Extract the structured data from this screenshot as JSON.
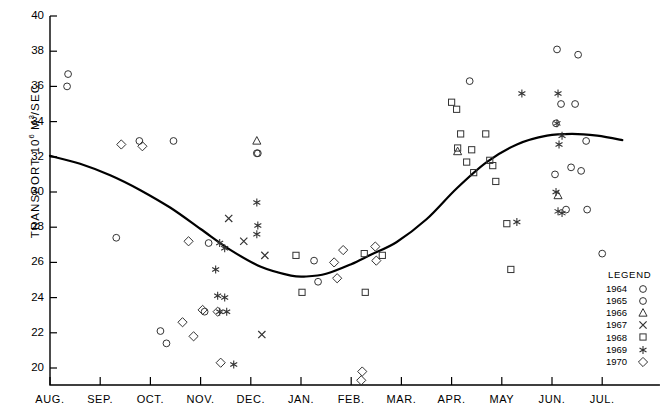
{
  "chart_data": {
    "type": "scatter",
    "title": "",
    "xlabel": "",
    "ylabel": "TRANSPORT 10⁶ M³/SEC.",
    "ylim": [
      19.1,
      40
    ],
    "yticks": [
      20,
      22,
      24,
      26,
      28,
      30,
      32,
      34,
      36,
      38,
      40
    ],
    "categories": [
      "AUG.",
      "SEP.",
      "OCT.",
      "NOV.",
      "DEC.",
      "JAN.",
      "FEB.",
      "MAR.",
      "APR.",
      "MAY",
      "JUN.",
      "JUL."
    ],
    "grid": false,
    "legend_position": "bottom-right",
    "legend_title": "LEGEND",
    "series": [
      {
        "name": "1964",
        "marker": "circle",
        "points": [
          {
            "month": "AUG.",
            "x": 0.36,
            "y": 36.7
          },
          {
            "month": "AUG.",
            "x": 0.34,
            "y": 36.0
          },
          {
            "month": "SEP.",
            "x": 1.78,
            "y": 32.9
          },
          {
            "month": "OCT.",
            "x": 2.46,
            "y": 32.9
          },
          {
            "month": "NOV.",
            "x": 3.16,
            "y": 27.1
          },
          {
            "month": "DEC.",
            "x": 4.14,
            "y": 32.2
          },
          {
            "month": "APR.",
            "x": 8.36,
            "y": 36.3
          },
          {
            "month": "JUN.",
            "x": 10.1,
            "y": 38.1
          },
          {
            "month": "JUN.",
            "x": 10.52,
            "y": 37.8
          },
          {
            "month": "JUN.",
            "x": 10.18,
            "y": 35.0
          },
          {
            "month": "JUN.",
            "x": 10.46,
            "y": 35.0
          },
          {
            "month": "JUN.",
            "x": 10.08,
            "y": 33.9
          },
          {
            "month": "JUN.",
            "x": 10.68,
            "y": 32.9
          },
          {
            "month": "JUN.",
            "x": 10.38,
            "y": 31.4
          },
          {
            "month": "JUN.",
            "x": 10.58,
            "y": 31.2
          },
          {
            "month": "JUN.",
            "x": 10.06,
            "y": 31.0
          },
          {
            "month": "JUN.",
            "x": 10.28,
            "y": 29.0
          },
          {
            "month": "JUN.",
            "x": 10.7,
            "y": 29.0
          },
          {
            "month": "JUL.",
            "x": 11.0,
            "y": 26.5
          }
        ]
      },
      {
        "name": "1965",
        "marker": "circle",
        "points": [
          {
            "month": "SEP.",
            "x": 1.32,
            "y": 27.4
          },
          {
            "month": "OCT.",
            "x": 2.2,
            "y": 22.1
          },
          {
            "month": "OCT.",
            "x": 2.32,
            "y": 21.4
          },
          {
            "month": "NOV.",
            "x": 3.08,
            "y": 23.2
          },
          {
            "month": "DEC.",
            "x": 4.12,
            "y": 32.2
          },
          {
            "month": "JAN.",
            "x": 5.26,
            "y": 26.1
          },
          {
            "month": "JAN.",
            "x": 5.34,
            "y": 24.9
          }
        ]
      },
      {
        "name": "1966",
        "marker": "triangle",
        "points": [
          {
            "month": "DEC.",
            "x": 4.12,
            "y": 32.9
          },
          {
            "month": "APR.",
            "x": 8.12,
            "y": 32.3
          },
          {
            "month": "JUN.",
            "x": 10.12,
            "y": 29.8
          }
        ]
      },
      {
        "name": "1967",
        "marker": "x",
        "points": [
          {
            "month": "NOV.",
            "x": 3.56,
            "y": 28.5
          },
          {
            "month": "DEC.",
            "x": 3.86,
            "y": 27.2
          },
          {
            "month": "DEC.",
            "x": 4.28,
            "y": 26.4
          },
          {
            "month": "DEC.",
            "x": 4.22,
            "y": 21.9
          }
        ]
      },
      {
        "name": "1968",
        "marker": "square",
        "points": [
          {
            "month": "DEC.",
            "x": 4.9,
            "y": 26.4
          },
          {
            "month": "JAN.",
            "x": 5.02,
            "y": 24.3
          },
          {
            "month": "FEB.",
            "x": 6.26,
            "y": 26.5
          },
          {
            "month": "FEB.",
            "x": 6.62,
            "y": 26.4
          },
          {
            "month": "FEB.",
            "x": 6.28,
            "y": 24.3
          },
          {
            "month": "APR.",
            "x": 8.0,
            "y": 35.1
          },
          {
            "month": "APR.",
            "x": 8.1,
            "y": 34.7
          },
          {
            "month": "APR.",
            "x": 8.18,
            "y": 33.3
          },
          {
            "month": "APR.",
            "x": 8.12,
            "y": 32.5
          },
          {
            "month": "APR.",
            "x": 8.4,
            "y": 32.4
          },
          {
            "month": "APR.",
            "x": 8.3,
            "y": 31.7
          },
          {
            "month": "APR.",
            "x": 8.44,
            "y": 31.1
          },
          {
            "month": "APR.",
            "x": 8.68,
            "y": 33.3
          },
          {
            "month": "APR.",
            "x": 8.76,
            "y": 31.8
          },
          {
            "month": "APR.",
            "x": 8.82,
            "y": 31.5
          },
          {
            "month": "APR.",
            "x": 8.88,
            "y": 30.6
          },
          {
            "month": "MAY",
            "x": 9.1,
            "y": 28.2
          },
          {
            "month": "MAY",
            "x": 9.18,
            "y": 25.6
          }
        ]
      },
      {
        "name": "1969",
        "marker": "asterisk",
        "points": [
          {
            "month": "NOV.",
            "x": 3.38,
            "y": 27.1
          },
          {
            "month": "NOV.",
            "x": 3.48,
            "y": 26.8
          },
          {
            "month": "NOV.",
            "x": 3.3,
            "y": 25.6
          },
          {
            "month": "NOV.",
            "x": 3.34,
            "y": 24.1
          },
          {
            "month": "NOV.",
            "x": 3.48,
            "y": 24.0
          },
          {
            "month": "NOV.",
            "x": 3.38,
            "y": 23.2
          },
          {
            "month": "NOV.",
            "x": 3.52,
            "y": 23.2
          },
          {
            "month": "NOV.",
            "x": 3.66,
            "y": 20.2
          },
          {
            "month": "DEC.",
            "x": 4.12,
            "y": 29.4
          },
          {
            "month": "DEC.",
            "x": 4.14,
            "y": 28.1
          },
          {
            "month": "DEC.",
            "x": 4.12,
            "y": 27.6
          },
          {
            "month": "MAY",
            "x": 9.4,
            "y": 35.6
          },
          {
            "month": "MAY",
            "x": 9.3,
            "y": 28.3
          },
          {
            "month": "JUN.",
            "x": 10.12,
            "y": 35.6
          },
          {
            "month": "JUN.",
            "x": 10.1,
            "y": 33.9
          },
          {
            "month": "JUN.",
            "x": 10.2,
            "y": 33.2
          },
          {
            "month": "JUN.",
            "x": 10.14,
            "y": 32.7
          },
          {
            "month": "JUN.",
            "x": 10.08,
            "y": 30.0
          },
          {
            "month": "JUN.",
            "x": 10.12,
            "y": 28.9
          },
          {
            "month": "JUN.",
            "x": 10.2,
            "y": 28.8
          }
        ]
      },
      {
        "name": "1970",
        "marker": "diamond",
        "points": [
          {
            "month": "SEP.",
            "x": 1.42,
            "y": 32.7
          },
          {
            "month": "SEP.",
            "x": 1.84,
            "y": 32.6
          },
          {
            "month": "OCT.",
            "x": 2.76,
            "y": 27.2
          },
          {
            "month": "NOV.",
            "x": 3.04,
            "y": 23.3
          },
          {
            "month": "NOV.",
            "x": 3.34,
            "y": 23.2
          },
          {
            "month": "NOV.",
            "x": 2.64,
            "y": 22.6
          },
          {
            "month": "NOV.",
            "x": 2.86,
            "y": 21.8
          },
          {
            "month": "NOV.",
            "x": 3.4,
            "y": 20.3
          },
          {
            "month": "JAN.",
            "x": 5.84,
            "y": 26.7
          },
          {
            "month": "JAN.",
            "x": 5.66,
            "y": 26.0
          },
          {
            "month": "JAN.",
            "x": 5.72,
            "y": 25.1
          },
          {
            "month": "FEB.",
            "x": 6.48,
            "y": 26.9
          },
          {
            "month": "FEB.",
            "x": 6.5,
            "y": 26.1
          },
          {
            "month": "FEB.",
            "x": 6.22,
            "y": 19.8
          },
          {
            "month": "FEB.",
            "x": 6.2,
            "y": 19.3
          }
        ]
      }
    ],
    "trend_curve": {
      "description": "smooth fitted seasonal mean transport curve",
      "points": [
        {
          "x": 0.0,
          "y": 32.05
        },
        {
          "x": 0.6,
          "y": 31.6
        },
        {
          "x": 1.2,
          "y": 30.95
        },
        {
          "x": 1.8,
          "y": 30.1
        },
        {
          "x": 2.4,
          "y": 29.1
        },
        {
          "x": 3.0,
          "y": 27.9
        },
        {
          "x": 3.6,
          "y": 26.7
        },
        {
          "x": 4.2,
          "y": 25.75
        },
        {
          "x": 4.8,
          "y": 25.25
        },
        {
          "x": 5.1,
          "y": 25.2
        },
        {
          "x": 5.5,
          "y": 25.35
        },
        {
          "x": 6.0,
          "y": 25.9
        },
        {
          "x": 6.4,
          "y": 26.45
        },
        {
          "x": 6.9,
          "y": 27.15
        },
        {
          "x": 7.5,
          "y": 28.45
        },
        {
          "x": 8.1,
          "y": 30.2
        },
        {
          "x": 8.7,
          "y": 31.7
        },
        {
          "x": 9.3,
          "y": 32.7
        },
        {
          "x": 9.9,
          "y": 33.2
        },
        {
          "x": 10.4,
          "y": 33.3
        },
        {
          "x": 10.9,
          "y": 33.2
        },
        {
          "x": 11.4,
          "y": 32.95
        }
      ]
    }
  }
}
